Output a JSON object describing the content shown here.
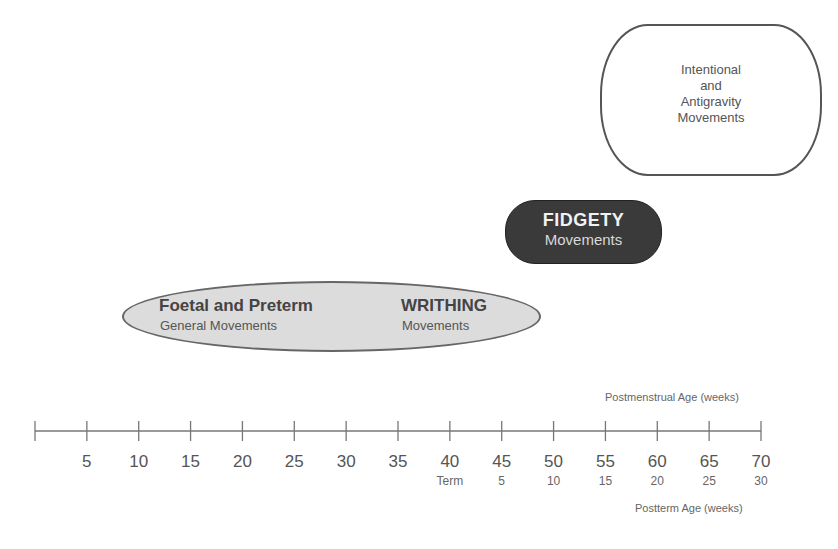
{
  "stages": {
    "intentional": {
      "lines": [
        "Intentional",
        "and",
        "Antigravity",
        "Movements"
      ]
    },
    "fidgety": {
      "title": "FIDGETY",
      "subtitle": "Movements"
    },
    "foetal": {
      "title": "Foetal and Preterm",
      "subtitle": "General Movements"
    },
    "writhing": {
      "title": "WRITHING",
      "subtitle": "Movements"
    }
  },
  "axis": {
    "postmenstrual_label": "Postmenstrual Age (weeks)",
    "postterm_label": "Postterm Age (weeks)",
    "min": 0,
    "max": 70,
    "ticks": [
      0,
      5,
      10,
      15,
      20,
      25,
      30,
      35,
      40,
      45,
      50,
      55,
      60,
      65,
      70
    ],
    "tick_labels": [
      "5",
      "10",
      "15",
      "20",
      "25",
      "30",
      "35",
      "40",
      "45",
      "50",
      "55",
      "60",
      "65",
      "70"
    ],
    "postterm_labels": [
      {
        "at": 40,
        "label": "Term"
      },
      {
        "at": 45,
        "label": "5"
      },
      {
        "at": 50,
        "label": "10"
      },
      {
        "at": 55,
        "label": "15"
      },
      {
        "at": 60,
        "label": "20"
      },
      {
        "at": 65,
        "label": "25"
      },
      {
        "at": 70,
        "label": "30"
      }
    ]
  },
  "colors": {
    "fidgety_fill": "#3a3a3a",
    "writhing_fill": "#dcdcdc",
    "line": "#777777"
  }
}
